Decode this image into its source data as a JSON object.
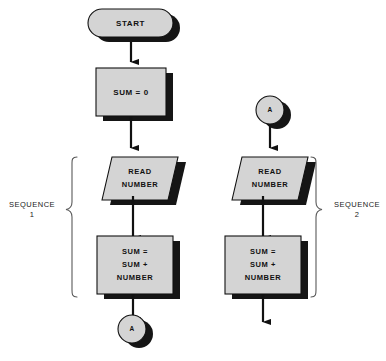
{
  "diagram": {
    "type": "flowchart",
    "title": "",
    "background_color": "#ffffff",
    "shape_fill_color": "#d4d4d4",
    "shape_outline_color": "#111111",
    "shadow_color": "#151515",
    "columns": [
      {
        "name": "sequence-1",
        "bracket_label_line1": "SEQUENCE",
        "bracket_label_line2": "1"
      },
      {
        "name": "sequence-2",
        "bracket_label_line1": "SEQUENCE",
        "bracket_label_line2": "2"
      }
    ],
    "left_column": {
      "terminator_start": {
        "text": "START",
        "shape": "stadium"
      },
      "process_init": {
        "text": "SUM = 0",
        "shape": "rectangle"
      },
      "io_read": {
        "line1": "READ",
        "line2": "NUMBER",
        "shape": "parallelogram"
      },
      "process_sum": {
        "line1": "SUM =",
        "line2": "SUM +",
        "line3": "NUMBER",
        "shape": "rectangle"
      },
      "connector_end": {
        "text": "A",
        "shape": "circle"
      }
    },
    "right_column": {
      "connector_start": {
        "text": "A",
        "shape": "circle"
      },
      "io_read": {
        "line1": "READ",
        "line2": "NUMBER",
        "shape": "parallelogram"
      },
      "process_sum": {
        "line1": "SUM =",
        "line2": "SUM +",
        "line3": "NUMBER",
        "shape": "rectangle"
      },
      "open_arrow": {
        "text": ""
      }
    }
  },
  "labels": {
    "sequence1_line1": "SEQUENCE",
    "sequence1_line2": "1",
    "sequence2_line1": "SEQUENCE",
    "sequence2_line2": "2",
    "start": "START",
    "sum_zero": "SUM = 0",
    "read": "READ",
    "number": "NUMBER",
    "sum_eq": "SUM =",
    "sum_plus": "SUM +",
    "sum_number": "NUMBER",
    "connector_a": "A"
  }
}
